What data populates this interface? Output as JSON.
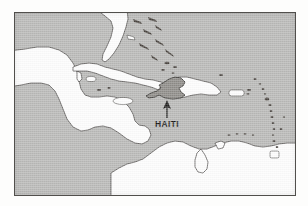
{
  "figure": {
    "kind": "locator-map",
    "region_depicted": "Caribbean Sea, Gulf of Mexico, Central America and northern South America",
    "background_color": "#fdfdfc",
    "frame_border_color": "#555350"
  },
  "map": {
    "ocean_color": "#b9b9b7",
    "land_fill_color": "#fdfdfd",
    "land_outline_color": "#3d3b39",
    "highlight_fill_color": "#8e8c88",
    "highlight_outline_color": "#2f2d2b",
    "frame": {
      "x": 14,
      "y": 12,
      "width": 282,
      "height": 184
    }
  },
  "annotation": {
    "label": "HAITI",
    "label_color": "#1b1a19",
    "arrow_color": "#201f1e",
    "arrow_direction": "up",
    "points_to": "haiti-highlight",
    "label_position": {
      "x": 158,
      "y": 117
    }
  },
  "features": {
    "highlighted": [
      {
        "name": "Haiti",
        "shaded": true
      }
    ],
    "landmasses": [
      {
        "name": "Florida peninsula"
      },
      {
        "name": "Mexico and Yucatan Peninsula"
      },
      {
        "name": "Central America"
      },
      {
        "name": "Northern South America"
      },
      {
        "name": "Cuba"
      },
      {
        "name": "Hispaniola"
      },
      {
        "name": "Jamaica"
      },
      {
        "name": "Puerto Rico"
      },
      {
        "name": "Bahamas"
      },
      {
        "name": "Lesser Antilles"
      },
      {
        "name": "Trinidad"
      }
    ]
  }
}
